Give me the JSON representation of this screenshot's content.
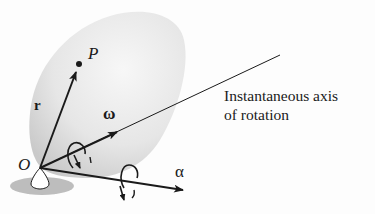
{
  "diagram": {
    "labels": {
      "point_p": "P",
      "position_vector": "r",
      "angular_velocity": "ω",
      "angular_acceleration": "α",
      "origin": "O",
      "axis_caption_line1": "Instantaneous axis",
      "axis_caption_line2": "of rotation"
    },
    "colors": {
      "body_fill": "#e4e4e4",
      "body_shadow": "#c8c8c8",
      "ground_shadow": "#bdbdbd",
      "vector": "#1a1a1a",
      "background": "#fdfdfd"
    }
  }
}
